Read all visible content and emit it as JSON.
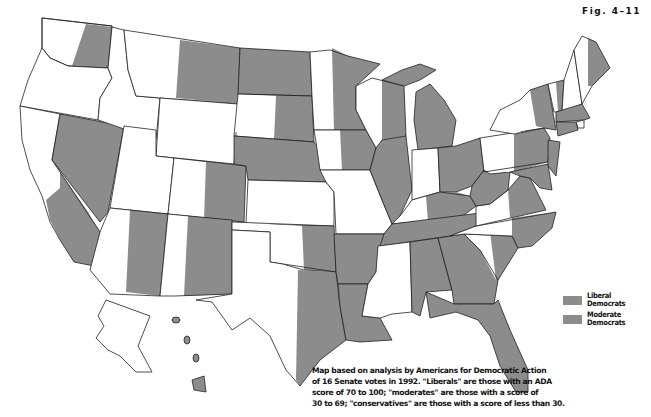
{
  "figure": {
    "label": "Fig. 4–11"
  },
  "legend": {
    "items": [
      {
        "label_line1": "Liberal",
        "label_line2": "Democrats",
        "color": "#8c8c8c"
      },
      {
        "label_line1": "Moderate",
        "label_line2": "Democrats",
        "color": "#8c8c8c"
      }
    ]
  },
  "note": {
    "lines": [
      "Map based on analysis by Americans for Democratic Action",
      "of 16 Senate votes in 1992. \"Liberals\" are those with an ADA",
      "score of 70 to 100; \"moderates\" are those with a score of",
      "30 to 69; \"conservatives\" are those with a score of less than 30."
    ]
  },
  "colors": {
    "democrat_fill": "#8c8c8c",
    "other_fill": "#ffffff",
    "border": "#222222"
  },
  "map": {
    "description": "U.S. states split into two halves, one per senator; gray half = Democratic senator (liberal or moderate), white half = not",
    "states": [
      {
        "state": "WA",
        "shading": "east half gray"
      },
      {
        "state": "OR",
        "shading": "white"
      },
      {
        "state": "CA",
        "shading": "east half gray"
      },
      {
        "state": "NV",
        "shading": "gray"
      },
      {
        "state": "ID",
        "shading": "white"
      },
      {
        "state": "MT",
        "shading": "east half gray"
      },
      {
        "state": "WY",
        "shading": "white"
      },
      {
        "state": "UT",
        "shading": "white"
      },
      {
        "state": "AZ",
        "shading": "east half gray"
      },
      {
        "state": "CO",
        "shading": "east half gray"
      },
      {
        "state": "NM",
        "shading": "east half gray"
      },
      {
        "state": "ND",
        "shading": "gray"
      },
      {
        "state": "SD",
        "shading": "east half gray"
      },
      {
        "state": "NE",
        "shading": "gray"
      },
      {
        "state": "KS",
        "shading": "white"
      },
      {
        "state": "OK",
        "shading": "east half gray"
      },
      {
        "state": "TX",
        "shading": "east half gray"
      },
      {
        "state": "MN",
        "shading": "east half gray"
      },
      {
        "state": "IA",
        "shading": "east half gray"
      },
      {
        "state": "MO",
        "shading": "white"
      },
      {
        "state": "AR",
        "shading": "gray"
      },
      {
        "state": "LA",
        "shading": "gray"
      },
      {
        "state": "WI",
        "shading": "east half gray"
      },
      {
        "state": "IL",
        "shading": "gray"
      },
      {
        "state": "MI",
        "shading": "gray"
      },
      {
        "state": "IN",
        "shading": "white"
      },
      {
        "state": "OH",
        "shading": "gray"
      },
      {
        "state": "KY",
        "shading": "east half gray"
      },
      {
        "state": "TN",
        "shading": "gray"
      },
      {
        "state": "MS",
        "shading": "white"
      },
      {
        "state": "AL",
        "shading": "gray"
      },
      {
        "state": "GA",
        "shading": "gray"
      },
      {
        "state": "FL",
        "shading": "gray"
      },
      {
        "state": "SC",
        "shading": "east half gray"
      },
      {
        "state": "NC",
        "shading": "east half gray"
      },
      {
        "state": "VA",
        "shading": "east half gray"
      },
      {
        "state": "WV",
        "shading": "gray"
      },
      {
        "state": "PA",
        "shading": "east half gray"
      },
      {
        "state": "NY",
        "shading": "east half gray"
      },
      {
        "state": "VT",
        "shading": "east half gray"
      },
      {
        "state": "NH",
        "shading": "white"
      },
      {
        "state": "ME",
        "shading": "east half gray"
      },
      {
        "state": "MA",
        "shading": "gray"
      },
      {
        "state": "CT",
        "shading": "gray"
      },
      {
        "state": "NJ",
        "shading": "gray"
      },
      {
        "state": "MD",
        "shading": "gray"
      },
      {
        "state": "AK",
        "shading": "white"
      },
      {
        "state": "HI",
        "shading": "gray"
      }
    ]
  }
}
